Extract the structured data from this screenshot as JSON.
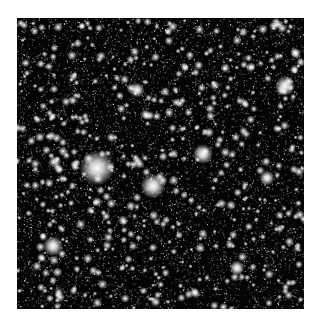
{
  "image": {
    "subject": "dense star field",
    "background_color": "#050505",
    "star_color": "#ffffff",
    "bright_stars": [
      {
        "x": 80,
        "y": 150,
        "r": 7
      },
      {
        "x": 136,
        "y": 168,
        "r": 5
      },
      {
        "x": 186,
        "y": 136,
        "r": 4
      },
      {
        "x": 268,
        "y": 68,
        "r": 4
      },
      {
        "x": 36,
        "y": 228,
        "r": 4
      },
      {
        "x": 120,
        "y": 72,
        "r": 3
      },
      {
        "x": 220,
        "y": 250,
        "r": 3
      },
      {
        "x": 250,
        "y": 160,
        "r": 3
      }
    ]
  }
}
